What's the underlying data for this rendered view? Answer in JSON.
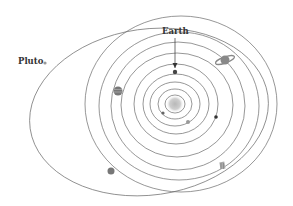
{
  "labels": {
    "earth": "Earth",
    "pluto": "Pluto"
  },
  "colors": {
    "orbit": "#6a6a6a",
    "sun": "#bdbdbd",
    "text": "#333333"
  },
  "bodies": [
    {
      "name": "sun-icon"
    },
    {
      "name": "mercury-icon"
    },
    {
      "name": "venus-icon"
    },
    {
      "name": "earth-icon"
    },
    {
      "name": "mars-icon"
    },
    {
      "name": "jupiter-icon"
    },
    {
      "name": "saturn-icon"
    },
    {
      "name": "uranus-icon"
    },
    {
      "name": "neptune-icon"
    },
    {
      "name": "pluto-icon"
    }
  ]
}
